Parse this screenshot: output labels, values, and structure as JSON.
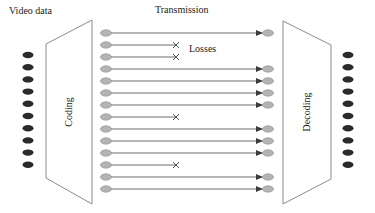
{
  "labels": {
    "video_data": "Video data",
    "transmission": "Transmission",
    "losses": "Losses",
    "coding": "Coding",
    "decoding": "Decoding"
  },
  "colors": {
    "source_dot": "#2b2b2b",
    "packet_fill": "#b4b4b4",
    "packet_stroke": "#8a8a8a",
    "line": "#6a6a6a",
    "loss_mark": "#555555",
    "block_stroke": "#8c8c8c"
  },
  "source_frames": {
    "count": 10
  },
  "output_frames": {
    "count": 10
  },
  "packets": [
    {
      "id": 1,
      "lost": false
    },
    {
      "id": 2,
      "lost": true
    },
    {
      "id": 3,
      "lost": true
    },
    {
      "id": 4,
      "lost": false
    },
    {
      "id": 5,
      "lost": false
    },
    {
      "id": 6,
      "lost": false
    },
    {
      "id": 7,
      "lost": false
    },
    {
      "id": 8,
      "lost": true
    },
    {
      "id": 9,
      "lost": false
    },
    {
      "id": 10,
      "lost": false
    },
    {
      "id": 11,
      "lost": false
    },
    {
      "id": 12,
      "lost": true
    },
    {
      "id": 13,
      "lost": false
    },
    {
      "id": 14,
      "lost": false
    }
  ]
}
